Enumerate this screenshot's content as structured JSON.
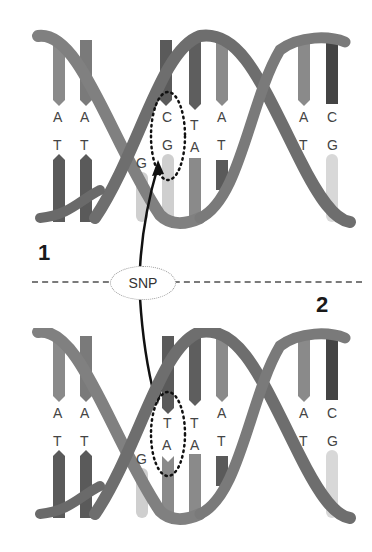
{
  "diagram": {
    "snp_label": "SNP",
    "divider_style": "dashed",
    "panels": [
      {
        "id": "1",
        "label": "1",
        "top_strand": [
          "A",
          "A",
          "G",
          "C",
          "T",
          "A",
          "G",
          "A",
          "C"
        ],
        "bottom_strand": [
          "T",
          "T",
          "C",
          "G",
          "A",
          "T",
          "C",
          "T",
          "G"
        ],
        "visible_top": [
          "A",
          "A",
          "",
          "C",
          "T",
          "A",
          "",
          "A",
          "C"
        ],
        "visible_bottom": [
          "T",
          "T",
          "G",
          "G",
          "A",
          "T",
          "",
          "T",
          "G"
        ],
        "highlighted_pair": {
          "top": "C",
          "bottom": "G"
        }
      },
      {
        "id": "2",
        "label": "2",
        "top_strand": [
          "A",
          "A",
          "G",
          "T",
          "T",
          "A",
          "G",
          "A",
          "C"
        ],
        "bottom_strand": [
          "T",
          "T",
          "C",
          "A",
          "A",
          "T",
          "C",
          "T",
          "G"
        ],
        "visible_top": [
          "A",
          "A",
          "",
          "T",
          "T",
          "A",
          "",
          "A",
          "C"
        ],
        "visible_bottom": [
          "T",
          "T",
          "G",
          "A",
          "A",
          "T",
          "",
          "T",
          "G"
        ],
        "highlighted_pair": {
          "top": "T",
          "bottom": "A"
        }
      }
    ],
    "colors": {
      "background": "#ffffff",
      "backbone": "#6e6e6e",
      "backbone_light": "#8c8c8c",
      "base_dark": "#5a5a5a",
      "base_mid": "#8a8a8a",
      "base_light": "#cfcfcf",
      "text": "#444444",
      "arrow": "#111111",
      "divider": "#7a7a7a"
    }
  }
}
